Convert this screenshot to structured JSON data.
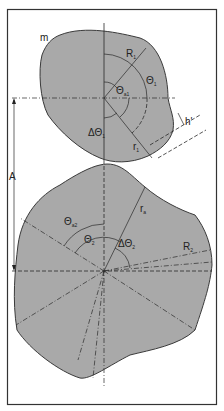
{
  "diagram": {
    "labels": {
      "m": "m",
      "R1": "R",
      "R1_sub": "1",
      "theta1": "Θ",
      "theta1_sub": "1",
      "theta_a1": "Θ",
      "theta_a1_sub": "a1",
      "delta_theta1": "ΔΘ",
      "delta_theta1_sub": "1",
      "r1": "r",
      "r1_sub": "1",
      "h_prime": "h'",
      "A": "A",
      "r2": "r",
      "r2_sub": "a",
      "theta_a2": "Θ",
      "theta_a2_sub": "a2",
      "theta2": "Θ",
      "theta2_sub": "2",
      "delta_theta2": "ΔΘ",
      "delta_theta2_sub": "2",
      "R2": "R",
      "R2_sub": "2"
    },
    "colors": {
      "shape_fill": "#a9a9a9",
      "line": "#2a2a2a",
      "background": "#ffffff"
    }
  }
}
